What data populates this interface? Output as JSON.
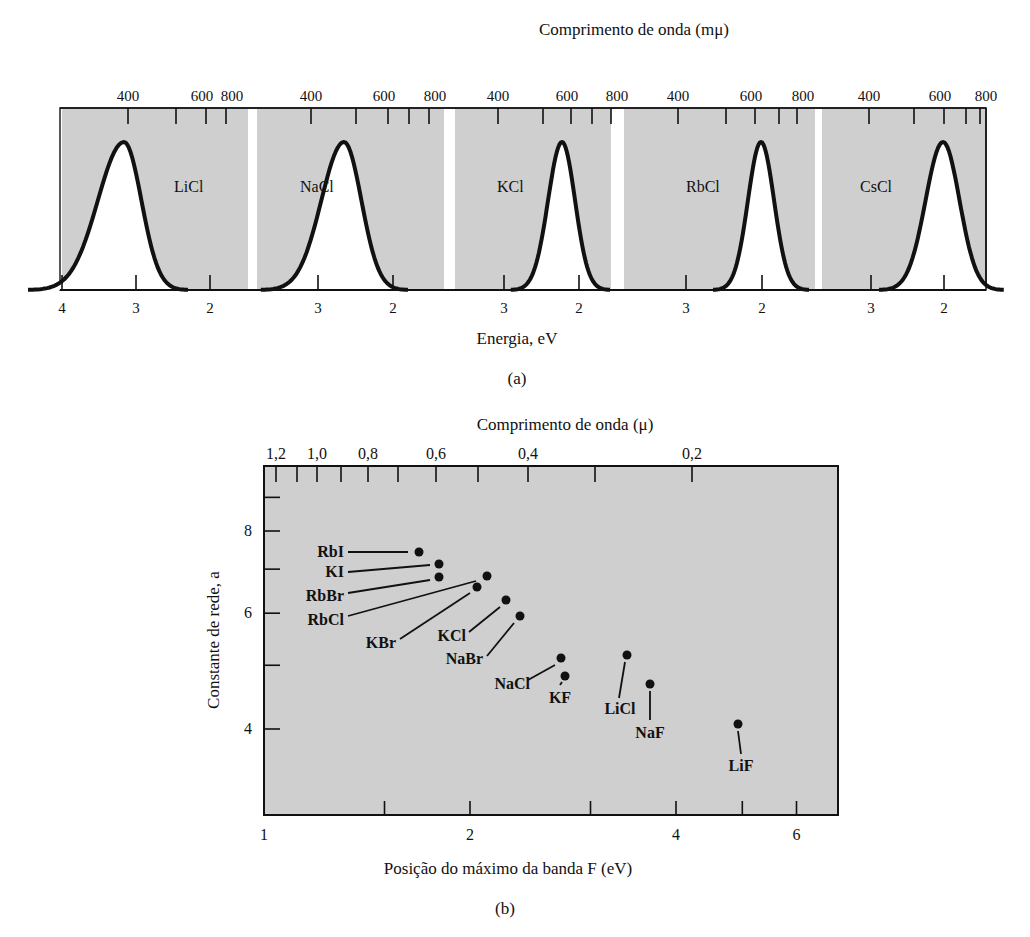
{
  "figure": {
    "panel_a_caption": "(a)",
    "panel_b_caption": "(b)"
  },
  "colors": {
    "plot_background": "#cfcfcf",
    "gap": "#ffffff",
    "curve": "#111111",
    "curve_fill": "#ffffff"
  },
  "chart_data": [
    {
      "type": "line",
      "title": "",
      "top_axis_label": "Comprimento de onda (mμ)",
      "xlabel": "Energia, eV",
      "caption": "(a)",
      "panels": [
        {
          "name": "LiCl",
          "peak_energy_eV": 3.1,
          "peak_wavelength_nm": 400,
          "top_ticks": [
            "400",
            "600",
            "800"
          ],
          "bottom_ticks": [
            "4",
            "3",
            "2"
          ]
        },
        {
          "name": "NaCl",
          "peak_energy_eV": 2.7,
          "peak_wavelength_nm": 460,
          "top_ticks": [
            "400",
            "600",
            "800"
          ],
          "bottom_ticks": [
            "3",
            "2"
          ]
        },
        {
          "name": "KCl",
          "peak_energy_eV": 2.2,
          "peak_wavelength_nm": 560,
          "top_ticks": [
            "400",
            "600",
            "800"
          ],
          "bottom_ticks": [
            "3",
            "2"
          ]
        },
        {
          "name": "RbCl",
          "peak_energy_eV": 2.0,
          "peak_wavelength_nm": 620,
          "top_ticks": [
            "400",
            "600",
            "800"
          ],
          "bottom_ticks": [
            "3",
            "2"
          ]
        },
        {
          "name": "CsCl",
          "peak_energy_eV": 2.0,
          "peak_wavelength_nm": 620,
          "top_ticks": [
            "400",
            "600",
            "800"
          ],
          "bottom_ticks": [
            "3",
            "2"
          ]
        }
      ]
    },
    {
      "type": "scatter",
      "title": "",
      "top_axis_label": "Comprimento de onda (μ)",
      "top_ticks": [
        "1,2",
        "1,0",
        "0,8",
        "0,6",
        "0,4",
        "0,2"
      ],
      "xlabel": "Posição do máximo da banda F (eV)",
      "ylabel": "Constante de rede, a",
      "x_ticks": [
        "1",
        "2",
        "4",
        "6"
      ],
      "y_ticks": [
        "4",
        "6",
        "8"
      ],
      "x_scale": "log",
      "y_scale": "log",
      "xlim": [
        1,
        6.5
      ],
      "ylim": [
        3.2,
        9.5
      ],
      "caption": "(b)",
      "points": [
        {
          "label": "RbI",
          "x": 1.6,
          "y": 7.33
        },
        {
          "label": "KI",
          "x": 1.7,
          "y": 7.05
        },
        {
          "label": "RbBr",
          "x": 1.7,
          "y": 6.85
        },
        {
          "label": "RbCl",
          "x": 2.05,
          "y": 6.58
        },
        {
          "label": "KBr",
          "x": 1.95,
          "y": 6.6
        },
        {
          "label": "KCl",
          "x": 2.2,
          "y": 6.29
        },
        {
          "label": "NaBr",
          "x": 2.35,
          "y": 5.97
        },
        {
          "label": "NaCl",
          "x": 2.75,
          "y": 5.64
        },
        {
          "label": "KF",
          "x": 2.8,
          "y": 5.35
        },
        {
          "label": "LiCl",
          "x": 3.4,
          "y": 5.14
        },
        {
          "label": "NaF",
          "x": 3.6,
          "y": 4.62
        },
        {
          "label": "LiF",
          "x": 5.0,
          "y": 4.02
        }
      ]
    }
  ]
}
